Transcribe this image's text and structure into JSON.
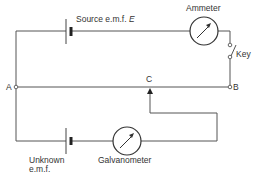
{
  "diagram": {
    "labels": {
      "source": "Source e.m.f.",
      "source_symbol": "E",
      "ammeter": "Ammeter",
      "key": "Key",
      "point_a": "A",
      "point_b": "B",
      "point_c": "C",
      "unknown_line1": "Unknown",
      "unknown_line2": "e.m.f.",
      "galvanometer": "Galvanometer"
    },
    "colors": {
      "wire": "#555555",
      "text": "#333333",
      "background": "#ffffff"
    },
    "components": [
      {
        "type": "cell",
        "name": "source-emf"
      },
      {
        "type": "meter",
        "name": "ammeter"
      },
      {
        "type": "switch",
        "name": "key"
      },
      {
        "type": "resistance-wire",
        "name": "wire-AB"
      },
      {
        "type": "sliding-contact",
        "name": "jockey-C"
      },
      {
        "type": "cell",
        "name": "unknown-emf"
      },
      {
        "type": "meter",
        "name": "galvanometer"
      }
    ]
  }
}
